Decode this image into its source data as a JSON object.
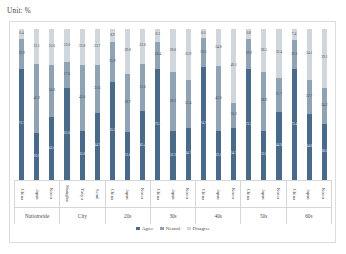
{
  "unit_label": "Unit: %",
  "legend": {
    "items": [
      {
        "label": "Agree",
        "color": "#4a6a8a"
      },
      {
        "label": "Neutral",
        "color": "#8fa3b5"
      },
      {
        "label": "Disagree",
        "color": "#cfd6dc"
      }
    ]
  },
  "chart_data": {
    "type": "bar",
    "subtype": "stacked-100-percent",
    "title": "",
    "xlabel": "",
    "ylabel": "",
    "ylim": [
      0,
      100
    ],
    "grid": false,
    "legend_position": "bottom",
    "series": [
      {
        "name": "Agree",
        "color": "#4a6a8a"
      },
      {
        "name": "Neutral",
        "color": "#8fa3b5"
      },
      {
        "name": "Disagree",
        "color": "#cfd6dc"
      }
    ],
    "groups": [
      {
        "name": "Nationwide",
        "bars": [
          {
            "category": "China",
            "Agree": 73.7,
            "Neutral": 19.9,
            "Disagree": 6.4
          },
          {
            "category": "Japan",
            "Agree": 30.9,
            "Neutral": 45.9,
            "Disagree": 23.1
          },
          {
            "category": "Korea",
            "Agree": 41.6,
            "Neutral": 34.8,
            "Disagree": 23.6
          }
        ]
      },
      {
        "name": "City",
        "bars": [
          {
            "category": "Shanghai",
            "Agree": 61.0,
            "Neutral": 17.0,
            "Disagree": 22.0
          },
          {
            "category": "Tokyo",
            "Agree": 32.6,
            "Neutral": 43.6,
            "Disagree": 23.8
          },
          {
            "category": "Seoul",
            "Agree": 44.7,
            "Neutral": 31.6,
            "Disagree": 23.7
          }
        ]
      },
      {
        "name": "20s",
        "bars": [
          {
            "category": "China",
            "Agree": 65.2,
            "Neutral": 25.9,
            "Disagree": 8.9
          },
          {
            "category": "Japan",
            "Agree": 31.6,
            "Neutral": 38.7,
            "Disagree": 29.8
          },
          {
            "category": "Korea",
            "Agree": 45.4,
            "Neutral": 31.6,
            "Disagree": 23.0
          }
        ]
      },
      {
        "name": "30s",
        "bars": [
          {
            "category": "China",
            "Agree": 73.3,
            "Neutral": 18.4,
            "Disagree": 8.3
          },
          {
            "category": "Japan",
            "Agree": 32.2,
            "Neutral": 39.2,
            "Disagree": 28.6
          },
          {
            "category": "Korea",
            "Agree": 34.7,
            "Neutral": 31.4,
            "Disagree": 33.9
          }
        ]
      },
      {
        "name": "40s",
        "bars": [
          {
            "category": "China",
            "Agree": 74.7,
            "Neutral": 19.3,
            "Disagree": 6.0
          },
          {
            "category": "Japan",
            "Agree": 32.2,
            "Neutral": 43.0,
            "Disagree": 24.8
          },
          {
            "category": "Korea",
            "Agree": 34.7,
            "Neutral": 16.2,
            "Disagree": 49.1
          }
        ]
      },
      {
        "name": "50s",
        "bars": [
          {
            "category": "China",
            "Agree": 73.3,
            "Neutral": 19.9,
            "Disagree": 6.8
          },
          {
            "category": "Japan",
            "Agree": 32.6,
            "Neutral": 38.9,
            "Disagree": 28.5
          },
          {
            "category": "Korea",
            "Agree": 44.9,
            "Neutral": 22.7,
            "Disagree": 32.4
          }
        ]
      },
      {
        "name": "60s",
        "bars": [
          {
            "category": "China",
            "Agree": 73.4,
            "Neutral": 19.2,
            "Disagree": 7.4
          },
          {
            "category": "Japan",
            "Agree": 44.6,
            "Neutral": 22.7,
            "Disagree": 34.1
          },
          {
            "category": "Korea",
            "Agree": 36.9,
            "Neutral": 24.2,
            "Disagree": 39.1
          }
        ]
      }
    ]
  }
}
